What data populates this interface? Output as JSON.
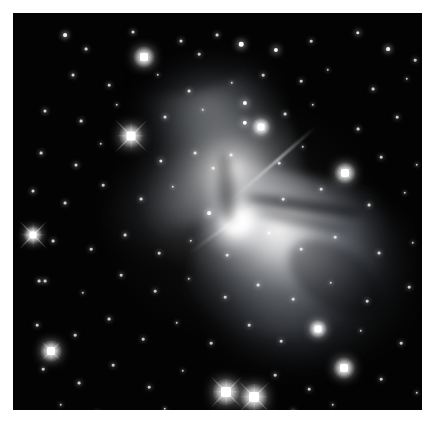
{
  "image": {
    "kind": "astronomical-photograph",
    "object_type": "bipolar reflection nebula",
    "alt_text": "Grayscale astronomical photograph of a bipolar (hourglass-shaped) reflection nebula with a bright compact core, two nebulous lobes extending to the upper-left and lower-right, dark dust lanes, set against a dense star field.",
    "background_color": "#000000",
    "page_color": "#ffffff",
    "nebula_color": "#ffffff",
    "frame": {
      "left": 13,
      "top": 13,
      "width": 409,
      "height": 397
    }
  },
  "nebula": {
    "core": {
      "x": 225,
      "y": 213,
      "label": "bright central core"
    },
    "lobes": [
      {
        "name": "northwest-lobe",
        "cx": 170,
        "cy": 110,
        "rx": 95,
        "ry": 90,
        "angle": -17,
        "brightness": 0.92
      },
      {
        "name": "southeast-lobe",
        "cx": 290,
        "cy": 275,
        "rx": 118,
        "ry": 115,
        "angle": 12,
        "brightness": 0.95
      }
    ],
    "dust_lanes": [
      {
        "name": "lane-east-upper",
        "x": 232,
        "y": 188,
        "w": 118,
        "h": 9,
        "angle": 8
      },
      {
        "name": "lane-east-lower",
        "x": 243,
        "y": 205,
        "w": 95,
        "h": 7,
        "angle": 12
      },
      {
        "name": "lane-waist-vertical",
        "x": 205,
        "y": 140,
        "w": 16,
        "h": 70,
        "angle": -4
      },
      {
        "name": "lane-southeast",
        "x": 270,
        "y": 235,
        "w": 105,
        "h": 60,
        "angle": 34
      },
      {
        "name": "lane-northwest",
        "x": 118,
        "y": 45,
        "w": 110,
        "h": 34,
        "angle": -9
      }
    ]
  },
  "bright_stars": [
    {
      "x": 118,
      "y": 123,
      "size": 9,
      "spike": 46,
      "name": "bright-star-upper-left"
    },
    {
      "x": 20,
      "y": 222,
      "size": 7,
      "spike": 40,
      "name": "bright-star-left-edge"
    },
    {
      "x": 213,
      "y": 379,
      "size": 10,
      "spike": 44,
      "name": "bright-star-bottom-left"
    },
    {
      "x": 241,
      "y": 384,
      "size": 10,
      "spike": 44,
      "name": "bright-star-bottom-right"
    },
    {
      "x": 38,
      "y": 338,
      "size": 8,
      "spike": 26,
      "name": "bright-star-lower-left"
    },
    {
      "x": 131,
      "y": 44,
      "size": 8,
      "spike": 16,
      "name": "bright-star-top"
    },
    {
      "x": 248,
      "y": 114,
      "size": 7,
      "spike": 16,
      "name": "bright-star-upper-right"
    },
    {
      "x": 332,
      "y": 160,
      "size": 8,
      "spike": 18,
      "name": "bright-star-right"
    },
    {
      "x": 331,
      "y": 355,
      "size": 8,
      "spike": 18,
      "name": "bright-star-lower-right"
    },
    {
      "x": 305,
      "y": 316,
      "size": 7,
      "spike": 14,
      "name": "bright-star-se-lobe"
    }
  ],
  "star_field": [
    {
      "x": 52,
      "y": 22,
      "s": 2
    },
    {
      "x": 73,
      "y": 36,
      "s": 1.5
    },
    {
      "x": 120,
      "y": 19,
      "s": 1.6
    },
    {
      "x": 168,
      "y": 28,
      "s": 1.6
    },
    {
      "x": 186,
      "y": 41,
      "s": 1.4
    },
    {
      "x": 204,
      "y": 22,
      "s": 1.5
    },
    {
      "x": 228,
      "y": 31,
      "s": 2.4
    },
    {
      "x": 263,
      "y": 37,
      "s": 2.2
    },
    {
      "x": 298,
      "y": 28,
      "s": 1.4
    },
    {
      "x": 345,
      "y": 20,
      "s": 1.8
    },
    {
      "x": 375,
      "y": 36,
      "s": 2
    },
    {
      "x": 402,
      "y": 47,
      "s": 1.4
    },
    {
      "x": 60,
      "y": 62,
      "s": 1.6
    },
    {
      "x": 96,
      "y": 72,
      "s": 1.4
    },
    {
      "x": 145,
      "y": 62,
      "s": 1.3
    },
    {
      "x": 176,
      "y": 78,
      "s": 1.5
    },
    {
      "x": 219,
      "y": 70,
      "s": 1.3
    },
    {
      "x": 250,
      "y": 62,
      "s": 1.4
    },
    {
      "x": 288,
      "y": 68,
      "s": 1.4
    },
    {
      "x": 315,
      "y": 57,
      "s": 1.3
    },
    {
      "x": 360,
      "y": 76,
      "s": 1.5
    },
    {
      "x": 394,
      "y": 66,
      "s": 1.3
    },
    {
      "x": 420,
      "y": 84,
      "s": 1.4
    },
    {
      "x": 32,
      "y": 98,
      "s": 1.6
    },
    {
      "x": 68,
      "y": 108,
      "s": 1.5
    },
    {
      "x": 104,
      "y": 92,
      "s": 1.3
    },
    {
      "x": 152,
      "y": 104,
      "s": 1.6
    },
    {
      "x": 190,
      "y": 97,
      "s": 1.3
    },
    {
      "x": 232,
      "y": 90,
      "s": 2.2
    },
    {
      "x": 232,
      "y": 110,
      "s": 2.3
    },
    {
      "x": 272,
      "y": 101,
      "s": 1.5
    },
    {
      "x": 300,
      "y": 92,
      "s": 1.3
    },
    {
      "x": 345,
      "y": 116,
      "s": 1.5
    },
    {
      "x": 384,
      "y": 104,
      "s": 1.4
    },
    {
      "x": 416,
      "y": 112,
      "s": 1.3
    },
    {
      "x": 28,
      "y": 140,
      "s": 1.5
    },
    {
      "x": 63,
      "y": 152,
      "s": 1.6
    },
    {
      "x": 88,
      "y": 131,
      "s": 1.3
    },
    {
      "x": 148,
      "y": 148,
      "s": 1.7
    },
    {
      "x": 182,
      "y": 140,
      "s": 1.5
    },
    {
      "x": 200,
      "y": 155,
      "s": 1.4
    },
    {
      "x": 218,
      "y": 142,
      "s": 1.5
    },
    {
      "x": 266,
      "y": 150,
      "s": 1.4
    },
    {
      "x": 290,
      "y": 134,
      "s": 1.3
    },
    {
      "x": 368,
      "y": 144,
      "s": 1.4
    },
    {
      "x": 404,
      "y": 152,
      "s": 1.3
    },
    {
      "x": 20,
      "y": 178,
      "s": 1.6
    },
    {
      "x": 52,
      "y": 190,
      "s": 1.5
    },
    {
      "x": 90,
      "y": 172,
      "s": 1.4
    },
    {
      "x": 128,
      "y": 186,
      "s": 1.5
    },
    {
      "x": 160,
      "y": 174,
      "s": 1.3
    },
    {
      "x": 196,
      "y": 200,
      "s": 2.0
    },
    {
      "x": 270,
      "y": 186,
      "s": 1.4
    },
    {
      "x": 308,
      "y": 176,
      "s": 1.4
    },
    {
      "x": 356,
      "y": 192,
      "s": 1.5
    },
    {
      "x": 392,
      "y": 180,
      "s": 1.3
    },
    {
      "x": 40,
      "y": 228,
      "s": 1.5
    },
    {
      "x": 78,
      "y": 236,
      "s": 1.4
    },
    {
      "x": 112,
      "y": 222,
      "s": 1.5
    },
    {
      "x": 146,
      "y": 240,
      "s": 1.4
    },
    {
      "x": 178,
      "y": 228,
      "s": 1.3
    },
    {
      "x": 214,
      "y": 242,
      "s": 1.4
    },
    {
      "x": 256,
      "y": 220,
      "s": 1.5
    },
    {
      "x": 288,
      "y": 236,
      "s": 1.4
    },
    {
      "x": 322,
      "y": 224,
      "s": 1.4
    },
    {
      "x": 366,
      "y": 240,
      "s": 1.5
    },
    {
      "x": 400,
      "y": 230,
      "s": 1.3
    },
    {
      "x": 26,
      "y": 268,
      "s": 1.5
    },
    {
      "x": 32,
      "y": 268,
      "s": 1.5
    },
    {
      "x": 70,
      "y": 280,
      "s": 1.3
    },
    {
      "x": 108,
      "y": 262,
      "s": 1.4
    },
    {
      "x": 142,
      "y": 278,
      "s": 1.4
    },
    {
      "x": 176,
      "y": 266,
      "s": 1.3
    },
    {
      "x": 212,
      "y": 284,
      "s": 1.4
    },
    {
      "x": 245,
      "y": 272,
      "s": 1.5
    },
    {
      "x": 280,
      "y": 286,
      "s": 1.4
    },
    {
      "x": 318,
      "y": 270,
      "s": 1.3
    },
    {
      "x": 354,
      "y": 288,
      "s": 1.4
    },
    {
      "x": 396,
      "y": 274,
      "s": 1.4
    },
    {
      "x": 24,
      "y": 312,
      "s": 1.4
    },
    {
      "x": 62,
      "y": 322,
      "s": 1.4
    },
    {
      "x": 96,
      "y": 306,
      "s": 1.5
    },
    {
      "x": 130,
      "y": 326,
      "s": 1.4
    },
    {
      "x": 164,
      "y": 310,
      "s": 1.3
    },
    {
      "x": 198,
      "y": 330,
      "s": 1.4
    },
    {
      "x": 236,
      "y": 312,
      "s": 1.4
    },
    {
      "x": 268,
      "y": 328,
      "s": 1.4
    },
    {
      "x": 348,
      "y": 318,
      "s": 1.3
    },
    {
      "x": 388,
      "y": 330,
      "s": 1.4
    },
    {
      "x": 418,
      "y": 308,
      "s": 1.3
    },
    {
      "x": 30,
      "y": 356,
      "s": 1.4
    },
    {
      "x": 66,
      "y": 370,
      "s": 1.5
    },
    {
      "x": 100,
      "y": 352,
      "s": 1.4
    },
    {
      "x": 136,
      "y": 374,
      "s": 1.4
    },
    {
      "x": 170,
      "y": 358,
      "s": 1.3
    },
    {
      "x": 262,
      "y": 362,
      "s": 1.4
    },
    {
      "x": 296,
      "y": 376,
      "s": 1.4
    },
    {
      "x": 368,
      "y": 366,
      "s": 1.4
    },
    {
      "x": 404,
      "y": 380,
      "s": 1.3
    },
    {
      "x": 48,
      "y": 392,
      "s": 1.3
    },
    {
      "x": 84,
      "y": 400,
      "s": 1.4
    },
    {
      "x": 152,
      "y": 396,
      "s": 1.3
    },
    {
      "x": 190,
      "y": 404,
      "s": 1.3
    },
    {
      "x": 280,
      "y": 398,
      "s": 1.4
    },
    {
      "x": 320,
      "y": 392,
      "s": 1.3
    },
    {
      "x": 358,
      "y": 404,
      "s": 1.3
    }
  ]
}
